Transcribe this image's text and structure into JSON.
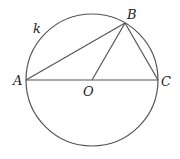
{
  "diagram": {
    "stroke_color": "#555555",
    "circle": {
      "name": "k",
      "cx": 92,
      "cy": 80,
      "r": 66
    },
    "points": {
      "A": {
        "label": "A",
        "x": 26,
        "y": 80
      },
      "B": {
        "label": "B",
        "x": 125,
        "y": 23
      },
      "C": {
        "label": "C",
        "x": 158,
        "y": 80
      },
      "O": {
        "label": "O",
        "x": 92,
        "y": 80
      }
    },
    "segments": [
      {
        "from": "A",
        "to": "C",
        "name": "diameter-AC"
      },
      {
        "from": "A",
        "to": "B",
        "name": "chord-AB"
      },
      {
        "from": "B",
        "to": "C",
        "name": "chord-BC"
      },
      {
        "from": "O",
        "to": "B",
        "name": "radius-OB"
      }
    ],
    "labels": {
      "k": "k",
      "A": "A",
      "B": "B",
      "C": "C",
      "O": "O"
    }
  }
}
